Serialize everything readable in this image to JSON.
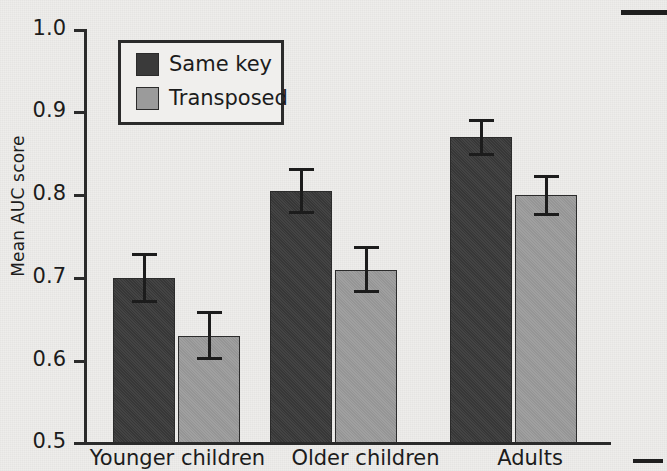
{
  "chart_data": {
    "type": "bar",
    "title": "",
    "xlabel": "",
    "ylabel": "Mean AUC score",
    "categories": [
      "Younger children",
      "Older children",
      "Adults"
    ],
    "ylim": [
      0.5,
      1.0
    ],
    "yticks": [
      "0.5",
      "0.6",
      "0.7",
      "0.8",
      "0.9",
      "1.0"
    ],
    "ytick_values": [
      0.5,
      0.6,
      0.7,
      0.8,
      0.9,
      1.0
    ],
    "grid": false,
    "legend_position": "upper-left-inside",
    "series": [
      {
        "name": "Same key",
        "color": "#3a3a3a",
        "values": [
          0.7,
          0.805,
          0.87
        ],
        "errors": [
          0.03,
          0.028,
          0.022
        ]
      },
      {
        "name": "Transposed",
        "color": "#9b9b9b",
        "values": [
          0.63,
          0.71,
          0.8
        ],
        "errors": [
          0.03,
          0.028,
          0.025
        ]
      }
    ]
  },
  "axis": {
    "y_label": "Mean AUC score",
    "tick_labels": [
      "1.0",
      "0.9",
      "0.8",
      "0.7",
      "0.6",
      "0.5"
    ]
  },
  "legend": {
    "entries": [
      {
        "label": "Same key",
        "swatch": "dark-square-swatch"
      },
      {
        "label": "Transposed",
        "swatch": "light-square-swatch"
      }
    ]
  },
  "categories": [
    "Younger children",
    "Older children",
    "Adults"
  ]
}
